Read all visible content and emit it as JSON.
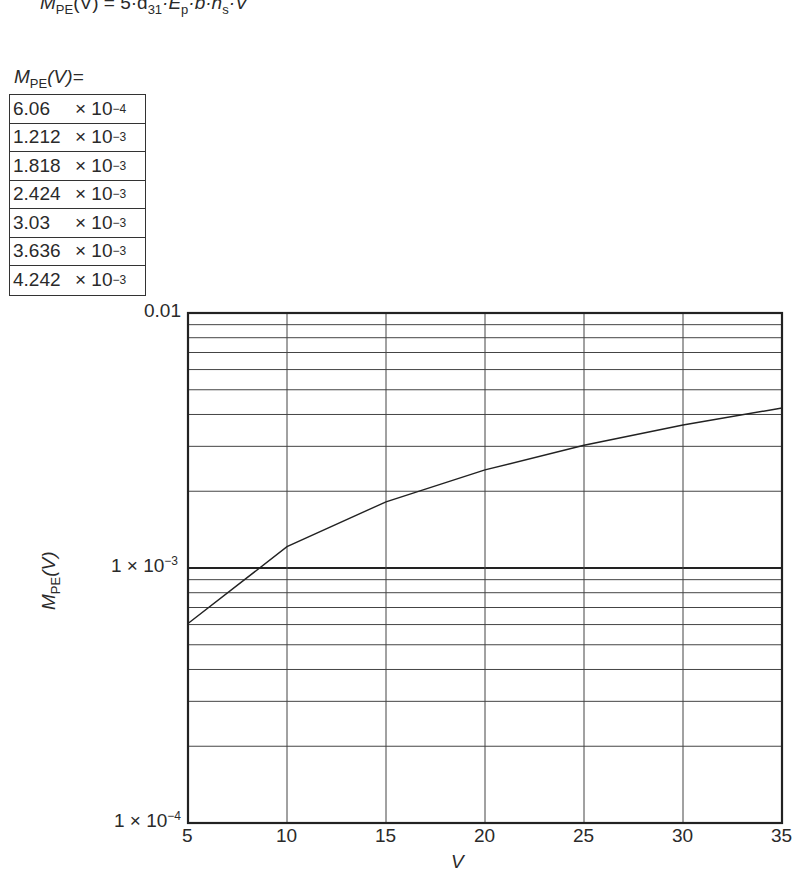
{
  "formula": {
    "lhs_main": "M",
    "lhs_sub": "PE",
    "lhs_arg": "(V)",
    "rhs": "= 5·d",
    "d_sub": "31",
    "e": "·E",
    "e_sub": "p",
    "b": "·b·h",
    "h_sub": "s",
    "v": "·V"
  },
  "table": {
    "title_main": "M",
    "title_sub": "PE",
    "title_arg": "(V)=",
    "rows": [
      {
        "value": "6.06",
        "times": "× 10",
        "exp": "−4"
      },
      {
        "value": "1.212",
        "times": "× 10",
        "exp": "−3"
      },
      {
        "value": "1.818",
        "times": "× 10",
        "exp": "−3"
      },
      {
        "value": "2.424",
        "times": "× 10",
        "exp": "−3"
      },
      {
        "value": "3.03",
        "times": "× 10",
        "exp": "−3"
      },
      {
        "value": "3.636",
        "times": "× 10",
        "exp": "−3"
      },
      {
        "value": "4.242",
        "times": "× 10",
        "exp": "−3"
      }
    ]
  },
  "axes": {
    "y_label_main": "M",
    "y_label_sub": "PE",
    "y_label_arg": "(V)",
    "x_label": "V",
    "y_ticks": [
      {
        "text": "0.01",
        "sup": ""
      },
      {
        "text": "1 × 10",
        "sup": "−3"
      },
      {
        "text": "1 × 10",
        "sup": "−4"
      }
    ],
    "x_ticks": [
      "5",
      "10",
      "15",
      "20",
      "25",
      "30",
      "35"
    ]
  },
  "chart_data": {
    "type": "line",
    "xlabel": "V",
    "ylabel": "M_PE(V)",
    "x": [
      5,
      10,
      15,
      20,
      25,
      30,
      35
    ],
    "series": [
      {
        "name": "M_PE(V)",
        "values": [
          0.000606,
          0.001212,
          0.001818,
          0.002424,
          0.00303,
          0.003636,
          0.004242
        ]
      }
    ],
    "xlim": [
      5,
      35
    ],
    "ylim": [
      0.0001,
      0.01
    ],
    "yscale": "log",
    "y_tick_labels": [
      "0.01",
      "1 × 10^-3",
      "1 × 10^-4"
    ],
    "x_tick_labels": [
      "5",
      "10",
      "15",
      "20",
      "25",
      "30",
      "35"
    ],
    "grid": true,
    "legend": "none"
  }
}
